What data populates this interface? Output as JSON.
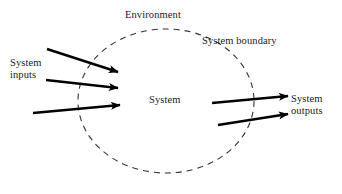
{
  "diagram": {
    "type": "system-context-diagram",
    "colors": {
      "background": "#ffffff",
      "text": "#1a1a1a",
      "arrow": "#000000",
      "boundary": "#333333"
    },
    "labels": {
      "environment": "Environment",
      "system_boundary": "System boundary",
      "system_inputs_line1": "System",
      "system_inputs_line2": "inputs",
      "system_center": "System",
      "system_outputs_line1": "System",
      "system_outputs_line2": "outputs"
    },
    "boundary": {
      "shape": "ellipse",
      "style": "dashed",
      "cx": 166,
      "cy": 101,
      "rx": 88,
      "ry": 72,
      "dash": "6 5",
      "stroke_width": 1.1
    },
    "arrows": {
      "inputs": [
        {
          "name": "input-arrow-1",
          "x1": 47,
          "y1": 49,
          "x2": 118,
          "y2": 72
        },
        {
          "name": "input-arrow-2",
          "x1": 46,
          "y1": 80,
          "x2": 118,
          "y2": 88
        },
        {
          "name": "input-arrow-3",
          "x1": 33,
          "y1": 113,
          "x2": 120,
          "y2": 105
        }
      ],
      "outputs": [
        {
          "name": "output-arrow-1",
          "x1": 212,
          "y1": 103,
          "x2": 288,
          "y2": 96
        },
        {
          "name": "output-arrow-2",
          "x1": 218,
          "y1": 125,
          "x2": 288,
          "y2": 114
        }
      ],
      "stroke_width": 2.4,
      "head_length": 9,
      "head_width": 7
    }
  }
}
